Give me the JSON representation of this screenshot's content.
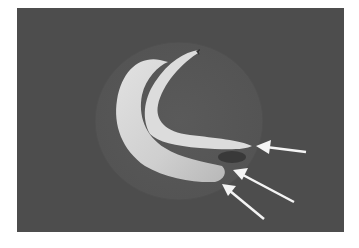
{
  "image": {
    "description": "Grayscale photograph of a curved, pale specimen on a dark circular disc against a dark gray background, with three white arrows pointing to the specimen's right end",
    "background_color": "#4d4d4d",
    "disc_color": "#575757",
    "specimen_color": "#d2d2d2",
    "arrow_color": "#f4f4f4",
    "arrows": [
      {
        "tip": [
          256,
          146
        ],
        "tail": [
          306,
          152
        ]
      },
      {
        "tip": [
          233,
          170
        ],
        "tail": [
          294,
          202
        ]
      },
      {
        "tip": [
          222,
          184
        ],
        "tail": [
          264,
          219
        ]
      }
    ]
  }
}
